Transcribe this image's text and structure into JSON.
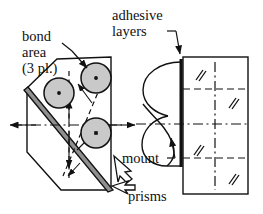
{
  "figure": {
    "type": "engineering-assembly-diagram",
    "background_color": "#ffffff",
    "line_color": "#111111",
    "bond_fill_color": "#c9c9c9",
    "band_fill_color": "#8f8f8f",
    "labels": {
      "bond_area_line1": "bond",
      "bond_area_line2": "area",
      "bond_area_line3": "(3 pl.)",
      "adhesive_line1": "adhesive",
      "adhesive_line2": "layers",
      "mount": "mount",
      "prisms": "prisms"
    },
    "annotations": {
      "bond_area_count": "3 pl.",
      "bond_circle_count": 3,
      "hatch_mark_count": 4
    }
  }
}
